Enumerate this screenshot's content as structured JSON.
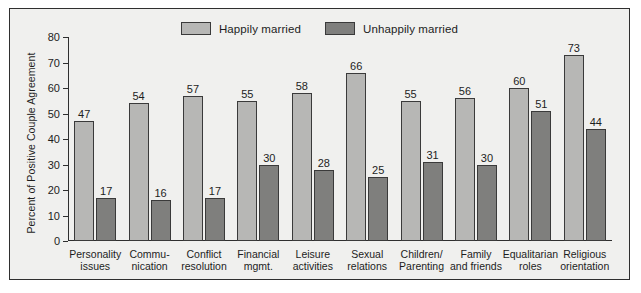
{
  "chart_data": {
    "type": "bar",
    "title": "",
    "xlabel": "",
    "ylabel": "Percent of Positive Couple Agreement",
    "ylim": [
      0,
      80
    ],
    "yticks": [
      0,
      10,
      20,
      30,
      40,
      50,
      60,
      70,
      80
    ],
    "grid": false,
    "legend_position": "top-center",
    "categories": [
      "Personality issues",
      "Commu- nication",
      "Conflict resolution",
      "Financial mgmt.",
      "Leisure activities",
      "Sexual relations",
      "Children/ Parenting",
      "Family and friends",
      "Equalitarian roles",
      "Religious orientation"
    ],
    "category_lines": [
      [
        "Personality",
        "issues"
      ],
      [
        "Commu-",
        "nication"
      ],
      [
        "Conflict",
        "resolution"
      ],
      [
        "Financial",
        "mgmt."
      ],
      [
        "Leisure",
        "activities"
      ],
      [
        "Sexual",
        "relations"
      ],
      [
        "Children/",
        "Parenting"
      ],
      [
        "Family",
        "and friends"
      ],
      [
        "Equalitarian",
        "roles"
      ],
      [
        "Religious",
        "orientation"
      ]
    ],
    "series": [
      {
        "name": "Happily married",
        "color": "#b7b7b5",
        "values": [
          47,
          54,
          57,
          55,
          58,
          66,
          55,
          56,
          60,
          73
        ]
      },
      {
        "name": "Unhappily married",
        "color": "#7f7f7d",
        "values": [
          17,
          16,
          17,
          30,
          28,
          25,
          31,
          30,
          51,
          44
        ]
      }
    ]
  },
  "legend": {
    "items": [
      {
        "label": "Happily married",
        "swatch": "happy"
      },
      {
        "label": "Unhappily married",
        "swatch": "unhappy"
      }
    ]
  },
  "colors": {
    "happy_bar": "#b7b7b5",
    "unhappy_bar": "#7f7f7d",
    "panel_background": "#f0f0ee",
    "axis": "#2f2f2f",
    "text": "#1d1d1d"
  }
}
